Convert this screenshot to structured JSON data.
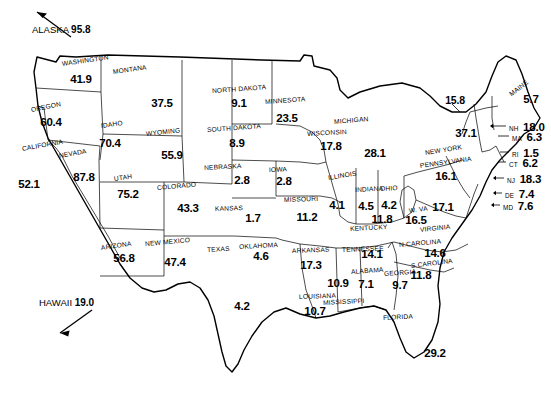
{
  "figure": {
    "type": "choropleth-style US map with per-state numeric labels",
    "offmap_notes": [
      {
        "name": "offmap-note-alaska",
        "label": "ALASKA",
        "value": "95.8",
        "arrow": "up-left"
      },
      {
        "name": "offmap-note-hawaii",
        "label": "HAWAII",
        "value": "19.0",
        "arrow": "down-left"
      }
    ]
  },
  "chart_data": {
    "type": "map",
    "title": "",
    "xlabel": "",
    "ylabel": "",
    "units": "",
    "categories": [
      "ALASKA",
      "WASHINGTON",
      "OREGON",
      "CALIFORNIA",
      "NEVADA",
      "IDAHO",
      "MONTANA",
      "WYOMING",
      "UTAH",
      "ARIZONA",
      "COLORADO",
      "NEW MEXICO",
      "NORTH DAKOTA",
      "SOUTH DAKOTA",
      "NEBRASKA",
      "KANSAS",
      "OKLAHOMA",
      "TEXAS",
      "MINNESOTA",
      "IOWA",
      "MISSOURI",
      "ARKANSAS",
      "LOUISIANA",
      "WISCONSIN",
      "ILLINOIS",
      "MICHIGAN",
      "INDIANA",
      "OHIO",
      "KENTUCKY",
      "TENNESSEE",
      "MISSISSIPPI",
      "ALABAMA",
      "GEORGIA",
      "FLORIDA",
      "S.CAROLINA",
      "N.CAROLINA",
      "VIRGINIA",
      "W. VA",
      "PENNSYLVANIA",
      "NEW YORK",
      "MAINE",
      "VT",
      "NH",
      "MA",
      "RI",
      "CT",
      "NJ",
      "DE",
      "MD",
      "HAWAII"
    ],
    "values": [
      95.8,
      41.9,
      60.4,
      52.1,
      87.8,
      70.4,
      37.5,
      55.9,
      75.2,
      56.8,
      43.3,
      47.4,
      9.1,
      8.9,
      2.8,
      1.7,
      4.6,
      4.2,
      23.5,
      2.8,
      11.2,
      17.3,
      10.7,
      17.8,
      4.1,
      28.1,
      4.5,
      4.2,
      11.8,
      14.1,
      10.9,
      7.1,
      9.7,
      29.2,
      11.8,
      14.6,
      17.1,
      16.5,
      16.1,
      37.1,
      5.7,
      15.8,
      18.0,
      6.3,
      1.5,
      6.2,
      18.3,
      7.4,
      7.6,
      19.0
    ],
    "legend": [],
    "grid": false
  },
  "states": [
    {
      "name": "state-washington",
      "label": "WASHINGTON",
      "value": "41.9",
      "lx": 62,
      "ly": 60,
      "lrot": -8,
      "vx": 81,
      "vy": 79
    },
    {
      "name": "state-oregon",
      "label": "OREGON",
      "value": "60.4",
      "lx": 31,
      "ly": 106,
      "lrot": -11,
      "vx": 51,
      "vy": 122
    },
    {
      "name": "state-california",
      "label": "CALIFORNIA",
      "value": "52.1",
      "lx": 22,
      "ly": 145,
      "lrot": -10,
      "vx": 29,
      "vy": 184
    },
    {
      "name": "state-nevada",
      "label": "NEVADA",
      "value": "87.8",
      "lx": 59,
      "ly": 152,
      "lrot": -10,
      "vx": 84,
      "vy": 177
    },
    {
      "name": "state-idaho",
      "label": "IDAHO",
      "value": "70.4",
      "lx": 101,
      "ly": 122,
      "lrot": -8,
      "vx": 110,
      "vy": 143
    },
    {
      "name": "state-montana",
      "label": "MONTANA",
      "value": "37.5",
      "lx": 113,
      "ly": 68,
      "lrot": -8,
      "vx": 162,
      "vy": 103
    },
    {
      "name": "state-wyoming",
      "label": "WYOMING",
      "value": "55.9",
      "lx": 146,
      "ly": 130,
      "lrot": -6,
      "vx": 172,
      "vy": 155
    },
    {
      "name": "state-utah",
      "label": "UTAH",
      "value": "75.2",
      "lx": 114,
      "ly": 175,
      "lrot": -8,
      "vx": 128,
      "vy": 194
    },
    {
      "name": "state-arizona",
      "label": "ARIZONA",
      "value": "56.8",
      "lx": 101,
      "ly": 244,
      "lrot": -8,
      "vx": 124,
      "vy": 258
    },
    {
      "name": "state-colorado",
      "label": "COLORADO",
      "value": "43.3",
      "lx": 157,
      "ly": 184,
      "lrot": -5,
      "vx": 188,
      "vy": 208
    },
    {
      "name": "state-newmexico",
      "label": "NEW MEXICO",
      "value": "47.4",
      "lx": 145,
      "ly": 240,
      "lrot": -5,
      "vx": 175,
      "vy": 262
    },
    {
      "name": "state-northdakota",
      "label": "NORTH DAKOTA",
      "value": "9.1",
      "lx": 212,
      "ly": 87,
      "lrot": -4,
      "vx": 239,
      "vy": 103
    },
    {
      "name": "state-southdakota",
      "label": "SOUTH DAKOTA",
      "value": "8.9",
      "lx": 207,
      "ly": 126,
      "lrot": -4,
      "vx": 237,
      "vy": 143
    },
    {
      "name": "state-nebraska",
      "label": "NEBRASKA",
      "value": "2.8",
      "lx": 204,
      "ly": 164,
      "lrot": -3,
      "vx": 242,
      "vy": 180
    },
    {
      "name": "state-kansas",
      "label": "KANSAS",
      "value": "1.7",
      "lx": 215,
      "ly": 205,
      "lrot": -2,
      "vx": 253,
      "vy": 218
    },
    {
      "name": "state-oklahoma",
      "label": "OKLAHOMA",
      "value": "4.6",
      "lx": 239,
      "ly": 243,
      "lrot": -3,
      "vx": 261,
      "vy": 256
    },
    {
      "name": "state-texas",
      "label": "TEXAS",
      "value": "4.2",
      "lx": 207,
      "ly": 246,
      "lrot": -3,
      "vx": 242,
      "vy": 306
    },
    {
      "name": "state-minnesota",
      "label": "MINNESOTA",
      "value": "23.5",
      "lx": 265,
      "ly": 98,
      "lrot": -4,
      "vx": 287,
      "vy": 118
    },
    {
      "name": "state-iowa",
      "label": "IOWA",
      "value": "2.8",
      "lx": 269,
      "ly": 166,
      "lrot": -2,
      "vx": 284,
      "vy": 181
    },
    {
      "name": "state-missouri",
      "label": "MISSOURI",
      "value": "11.2",
      "lx": 284,
      "ly": 196,
      "lrot": -2,
      "vx": 307,
      "vy": 217
    },
    {
      "name": "state-arkansas",
      "label": "ARKANSAS",
      "value": "17.3",
      "lx": 292,
      "ly": 247,
      "lrot": -2,
      "vx": 311,
      "vy": 265
    },
    {
      "name": "state-louisiana",
      "label": "LOUISIANA",
      "value": "10.7",
      "lx": 299,
      "ly": 293,
      "lrot": -2,
      "vx": 315,
      "vy": 311
    },
    {
      "name": "state-wisconsin",
      "label": "WISCONSIN",
      "value": "17.8",
      "lx": 307,
      "ly": 130,
      "lrot": -3,
      "vx": 331,
      "vy": 146
    },
    {
      "name": "state-illinois",
      "label": "ILLINOIS",
      "value": "4.1",
      "lx": 328,
      "ly": 174,
      "lrot": -9,
      "vx": 337,
      "vy": 205
    },
    {
      "name": "state-michigan",
      "label": "MICHIGAN",
      "value": "28.1",
      "lx": 334,
      "ly": 118,
      "lrot": -5,
      "vx": 375,
      "vy": 153
    },
    {
      "name": "state-indiana",
      "label": "INDIANA",
      "value": "4.5",
      "lx": 355,
      "ly": 186,
      "lrot": -3,
      "vx": 366,
      "vy": 206
    },
    {
      "name": "state-ohio",
      "label": "OHIO",
      "value": "4.2",
      "lx": 380,
      "ly": 185,
      "lrot": -3,
      "vx": 389,
      "vy": 205
    },
    {
      "name": "state-kentucky",
      "label": "KENTUCKY",
      "value": "11.8",
      "lx": 350,
      "ly": 225,
      "lrot": -3,
      "vx": 382,
      "vy": 219
    },
    {
      "name": "state-tennessee",
      "label": "TENNESSEE",
      "value": "14.1",
      "lx": 342,
      "ly": 246,
      "lrot": -2,
      "vx": 372,
      "vy": 254
    },
    {
      "name": "state-mississippi",
      "label": "MISSISSIPPI",
      "value": "10.9",
      "lx": 323,
      "ly": 299,
      "lrot": -3,
      "vx": 338,
      "vy": 283
    },
    {
      "name": "state-alabama",
      "label": "ALABAMA",
      "value": "7.1",
      "lx": 351,
      "ly": 268,
      "lrot": -4,
      "vx": 366,
      "vy": 284
    },
    {
      "name": "state-georgia",
      "label": "GEORGIA",
      "value": "9.7",
      "lx": 384,
      "ly": 270,
      "lrot": -4,
      "vx": 400,
      "vy": 285
    },
    {
      "name": "state-florida",
      "label": "FLORIDA",
      "value": "29.2",
      "lx": 383,
      "ly": 314,
      "lrot": -3,
      "vx": 435,
      "vy": 353
    },
    {
      "name": "state-scarolina",
      "label": "S.CAROLINA",
      "value": "11.8",
      "lx": 411,
      "ly": 262,
      "lrot": -7,
      "vx": 421,
      "vy": 275
    },
    {
      "name": "state-ncarolina",
      "label": "N.CAROLINA",
      "value": "14.6",
      "lx": 399,
      "ly": 241,
      "lrot": -5,
      "vx": 435,
      "vy": 253
    },
    {
      "name": "state-virginia",
      "label": "VIRGINIA",
      "value": "17.1",
      "lx": 420,
      "ly": 226,
      "lrot": -6,
      "vx": 443,
      "vy": 207
    },
    {
      "name": "state-westvirginia",
      "label": "W. VA",
      "value": "16.5",
      "lx": 409,
      "ly": 207,
      "lrot": -8,
      "vx": 416,
      "vy": 220
    },
    {
      "name": "state-pennsylvania",
      "label": "PENNSYLVANIA",
      "value": "16.1",
      "lx": 420,
      "ly": 162,
      "lrot": -8,
      "vx": 446,
      "vy": 176
    },
    {
      "name": "state-newyork",
      "label": "NEW YORK",
      "value": "37.1",
      "lx": 425,
      "ly": 149,
      "lrot": -9,
      "vx": 466,
      "vy": 133
    },
    {
      "name": "state-maine",
      "label": "MAINE",
      "value": "5.7",
      "lx": 510,
      "ly": 91,
      "lrot": -38,
      "vx": 531,
      "vy": 99
    }
  ],
  "leader_labels": [
    {
      "name": "leader-vermont",
      "ab": "",
      "value": "15.8",
      "x": 455,
      "y": 100,
      "anchor": "above"
    }
  ],
  "callouts": [
    {
      "name": "callout-nh",
      "ab": "NH",
      "value": "18.0",
      "x": 509,
      "y": 126
    },
    {
      "name": "callout-ma",
      "ab": "MA",
      "value": "6.3",
      "x": 512,
      "y": 136
    },
    {
      "name": "callout-ri",
      "ab": "RI",
      "value": "1.5",
      "x": 512,
      "y": 152
    },
    {
      "name": "callout-ct",
      "ab": "CT",
      "value": "6.2",
      "x": 509,
      "y": 162
    },
    {
      "name": "callout-nj",
      "ab": "NJ",
      "value": "18.3",
      "x": 507,
      "y": 178
    },
    {
      "name": "callout-de",
      "ab": "DE",
      "value": "7.4",
      "x": 505,
      "y": 193
    },
    {
      "name": "callout-md",
      "ab": "MD",
      "value": "7.6",
      "x": 503,
      "y": 205
    }
  ],
  "colors": {
    "ink": "#000000",
    "lake_fill": "#d2d2d2",
    "state_fill": "#ffffff",
    "background": "#ffffff"
  }
}
